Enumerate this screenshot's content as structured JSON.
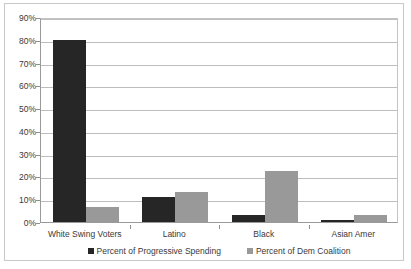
{
  "chart_data": {
    "type": "bar",
    "title": "",
    "subtitle": "",
    "xlabel": "",
    "ylabel": "",
    "ylim": [
      0,
      90
    ],
    "ytick_labels": [
      "0%",
      "10%",
      "20%",
      "30%",
      "40%",
      "50%",
      "60%",
      "70%",
      "80%",
      "90%"
    ],
    "ytick_values": [
      0,
      10,
      20,
      30,
      40,
      50,
      60,
      70,
      80,
      90
    ],
    "grid": true,
    "legend_position": "bottom-center",
    "categories": [
      "White Swing Voters",
      "Latino",
      "Black",
      "Asian Amer"
    ],
    "series": [
      {
        "name": "Percent of Progressive Spending",
        "color": "#262626",
        "values": [
          80,
          11,
          3,
          1
        ]
      },
      {
        "name": "Percent of Dem Coalition",
        "color": "#999999",
        "values": [
          6.5,
          13,
          22.5,
          3
        ]
      }
    ]
  },
  "legend": {
    "entries": [
      {
        "label": "Percent of Progressive Spending",
        "marker": "square-marker-dark"
      },
      {
        "label": "Percent of Dem Coalition",
        "marker": "square-marker-light"
      }
    ]
  }
}
